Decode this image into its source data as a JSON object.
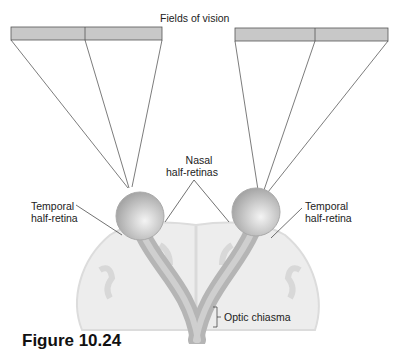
{
  "title": "Fields of vision",
  "labels": {
    "nasal": [
      "Nasal",
      "half-retinas"
    ],
    "temporal_left": [
      "Temporal",
      "half-retina"
    ],
    "temporal_right": [
      "Temporal",
      "half-retina"
    ],
    "chiasma": "Optic chiasma"
  },
  "figure_caption": "Figure 10.24",
  "colors": {
    "field_fill": "#c8c8c8",
    "brain_fill": "#ededed",
    "nerve": "#b5b5b5",
    "line": "#333333"
  }
}
